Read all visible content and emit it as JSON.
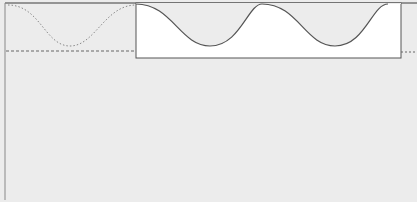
{
  "diagram": {
    "background_color": "#ececec",
    "page_color": "#ececec",
    "box_color": "#ffffff",
    "line_color": "#555555",
    "left_border": {
      "x": 5,
      "y_top": 3,
      "y_bottom": 200
    },
    "top_edge": {
      "y": 3
    },
    "dotted_wave": {
      "x_start": 8,
      "x_end": 136,
      "crest_y": 5,
      "trough_y": 46,
      "trough_x": 70
    },
    "left_dashed_line": {
      "y": 51,
      "x_start": 6,
      "x_end": 136
    },
    "white_box": {
      "x": 136,
      "y": 3,
      "width": 265,
      "height": 55
    },
    "solid_waves": [
      {
        "x_start": 136,
        "x_end": 262,
        "trough_x": 210,
        "trough_y": 46
      },
      {
        "x_start": 262,
        "x_end": 388,
        "trough_x": 335,
        "trough_y": 46
      }
    ],
    "right_dashed_line": {
      "y": 52,
      "x_start": 401,
      "x_end": 417
    }
  }
}
